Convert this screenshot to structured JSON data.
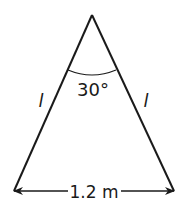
{
  "diagram": {
    "type": "isosceles-triangle",
    "apex_angle_label": "30°",
    "left_side_label": "l",
    "right_side_label": "l",
    "base_label": "1.2 m",
    "colors": {
      "stroke": "#1a1a1a",
      "background": "#ffffff"
    }
  }
}
